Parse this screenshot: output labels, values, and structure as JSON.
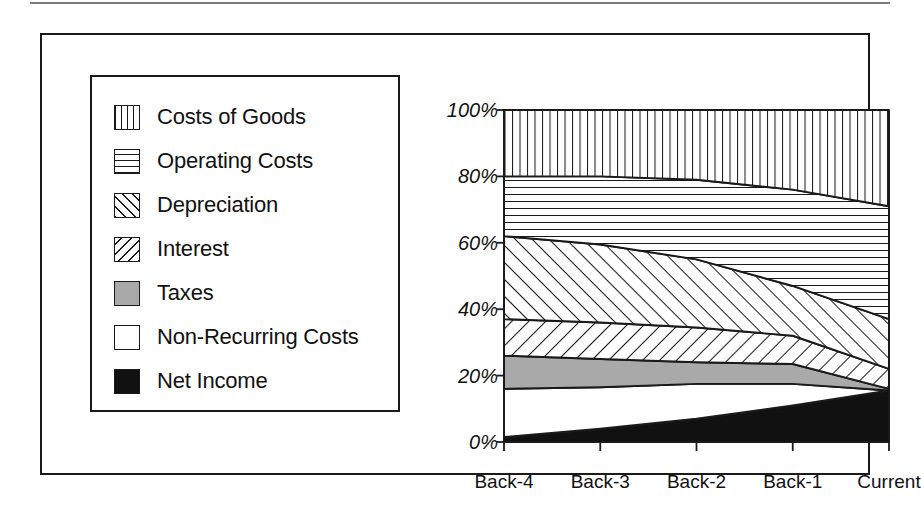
{
  "figure": {
    "frame_color": "#1a1a1a",
    "background": "#ffffff"
  },
  "legend": {
    "items": [
      {
        "label": "Costs of Goods",
        "pattern": "vertical-lines",
        "swatch_name": "legend-swatch-costs-of-goods"
      },
      {
        "label": "Operating Costs",
        "pattern": "horizontal-lines",
        "swatch_name": "legend-swatch-operating-costs"
      },
      {
        "label": "Depreciation",
        "pattern": "diagonal-up",
        "swatch_name": "legend-swatch-depreciation"
      },
      {
        "label": "Interest",
        "pattern": "diagonal-down",
        "swatch_name": "legend-swatch-interest"
      },
      {
        "label": "Taxes",
        "pattern": "solid-gray",
        "swatch_name": "legend-swatch-taxes"
      },
      {
        "label": "Non-Recurring Costs",
        "pattern": "solid-white",
        "swatch_name": "legend-swatch-non-recurring-costs"
      },
      {
        "label": "Net Income",
        "pattern": "solid-black",
        "swatch_name": "legend-swatch-net-income"
      }
    ]
  },
  "chart_data": {
    "type": "area",
    "stacked": true,
    "normalized": true,
    "title": "",
    "xlabel": "",
    "ylabel": "",
    "categories": [
      "Back-4",
      "Back-3",
      "Back-2",
      "Back-1",
      "Current"
    ],
    "x_tick_labels": [
      "Back-4",
      "Back-3",
      "Back-2",
      "Back-1",
      "Current"
    ],
    "y_tick_labels": [
      "0%",
      "20%",
      "40%",
      "60%",
      "80%",
      "100%"
    ],
    "y_tick_values": [
      0,
      20,
      40,
      60,
      80,
      100
    ],
    "ylim": [
      0,
      100
    ],
    "grid": false,
    "legend_position": "left-outside",
    "stack_order_bottom_to_top": [
      "Net Income",
      "Non-Recurring Costs",
      "Taxes",
      "Interest",
      "Depreciation",
      "Operating Costs",
      "Costs of Goods"
    ],
    "series": [
      {
        "name": "Net Income",
        "pattern": "solid-black",
        "values": [
          1.5,
          4.0,
          7.0,
          11.0,
          15.5
        ]
      },
      {
        "name": "Non-Recurring Costs",
        "pattern": "solid-white",
        "values": [
          14.5,
          12.5,
          10.5,
          6.5,
          0.0
        ]
      },
      {
        "name": "Taxes",
        "pattern": "solid-gray",
        "values": [
          10.0,
          8.5,
          6.5,
          6.0,
          0.5
        ]
      },
      {
        "name": "Interest",
        "pattern": "diagonal-down",
        "values": [
          11.0,
          11.0,
          10.5,
          8.5,
          6.0
        ]
      },
      {
        "name": "Depreciation",
        "pattern": "diagonal-up",
        "values": [
          25.0,
          23.5,
          20.5,
          15.0,
          15.0
        ]
      },
      {
        "name": "Operating Costs",
        "pattern": "horizontal-lines",
        "values": [
          18.0,
          20.5,
          24.0,
          29.0,
          34.0
        ]
      },
      {
        "name": "Costs of Goods",
        "pattern": "vertical-lines",
        "values": [
          20.0,
          20.0,
          21.0,
          24.0,
          29.0
        ]
      }
    ],
    "cumulative_boundaries": {
      "net_income_top": [
        1.5,
        4.0,
        7.0,
        11.0,
        15.5
      ],
      "non_recurring_top": [
        16.0,
        16.5,
        17.5,
        17.5,
        15.5
      ],
      "taxes_top": [
        26.0,
        25.0,
        24.0,
        23.5,
        16.0
      ],
      "interest_top": [
        37.0,
        36.0,
        34.5,
        32.0,
        22.0
      ],
      "depreciation_top": [
        62.0,
        59.5,
        55.0,
        47.0,
        37.0
      ],
      "operating_costs_top": [
        80.0,
        80.0,
        79.0,
        76.0,
        71.0
      ],
      "costs_of_goods_top": [
        100.0,
        100.0,
        100.0,
        100.0,
        100.0
      ]
    },
    "colors": {
      "line": "#1a1a1a",
      "taxes_fill": "#a9a9a9",
      "net_income_fill": "#111111",
      "non_recurring_fill": "#ffffff"
    }
  }
}
